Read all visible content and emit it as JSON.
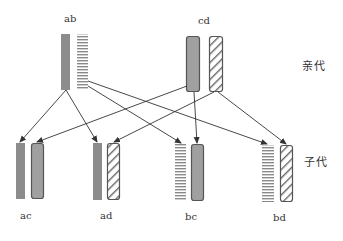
{
  "diagram": {
    "type": "genetic-cross",
    "generation_labels": {
      "parent": "亲代",
      "offspring": "子代"
    },
    "parents": [
      {
        "label": "ab",
        "chromosomes": [
          "a",
          "b"
        ]
      },
      {
        "label": "cd",
        "chromosomes": [
          "c",
          "d"
        ]
      }
    ],
    "offspring": [
      {
        "label": "ac",
        "chromosomes": [
          "a",
          "c"
        ]
      },
      {
        "label": "ad",
        "chromosomes": [
          "a",
          "d"
        ]
      },
      {
        "label": "bc",
        "chromosomes": [
          "b",
          "c"
        ]
      },
      {
        "label": "bd",
        "chromosomes": [
          "b",
          "d"
        ]
      }
    ],
    "chromosome_styles": {
      "a": "solid-gray",
      "b": "horizontal-stripes",
      "c": "solid-gray-rounded-outlined",
      "d": "diagonal-stripes-rounded-outlined"
    },
    "arrows": [
      {
        "from": "a",
        "to": "ac.a"
      },
      {
        "from": "a",
        "to": "ad.a"
      },
      {
        "from": "b",
        "to": "bc.b"
      },
      {
        "from": "b",
        "to": "bd.b"
      },
      {
        "from": "c",
        "to": "ac.c"
      },
      {
        "from": "c",
        "to": "bc.c"
      },
      {
        "from": "d",
        "to": "ad.d"
      },
      {
        "from": "d",
        "to": "bd.d"
      }
    ],
    "colors": {
      "gray_fill": "#8c8c8c",
      "gray_fill_light": "#a6a6a6",
      "outline": "#555555",
      "stripe": "#888888",
      "arrow": "#333333"
    }
  }
}
